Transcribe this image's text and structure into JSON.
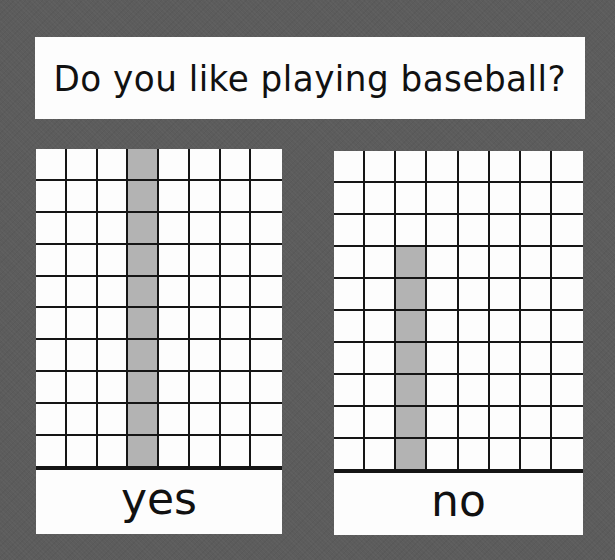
{
  "title": "Do you like playing baseball?",
  "colors": {
    "background": "#5c5c5c",
    "paper": "#fdfdfd",
    "grid_line": "#151515",
    "bar_fill": "#b3b3b3"
  },
  "panels": [
    {
      "label": "yes",
      "columns": 8,
      "rows": 10,
      "bar_column": 4,
      "value": 10
    },
    {
      "label": "no",
      "columns": 8,
      "rows": 10,
      "bar_column": 3,
      "value": 7
    }
  ],
  "chart_data": {
    "type": "bar",
    "title": "Do you like playing baseball?",
    "categories": [
      "yes",
      "no"
    ],
    "values": [
      10,
      7
    ],
    "xlabel": "",
    "ylabel": "",
    "ylim": [
      0,
      10
    ],
    "grid": true,
    "legend": null
  }
}
